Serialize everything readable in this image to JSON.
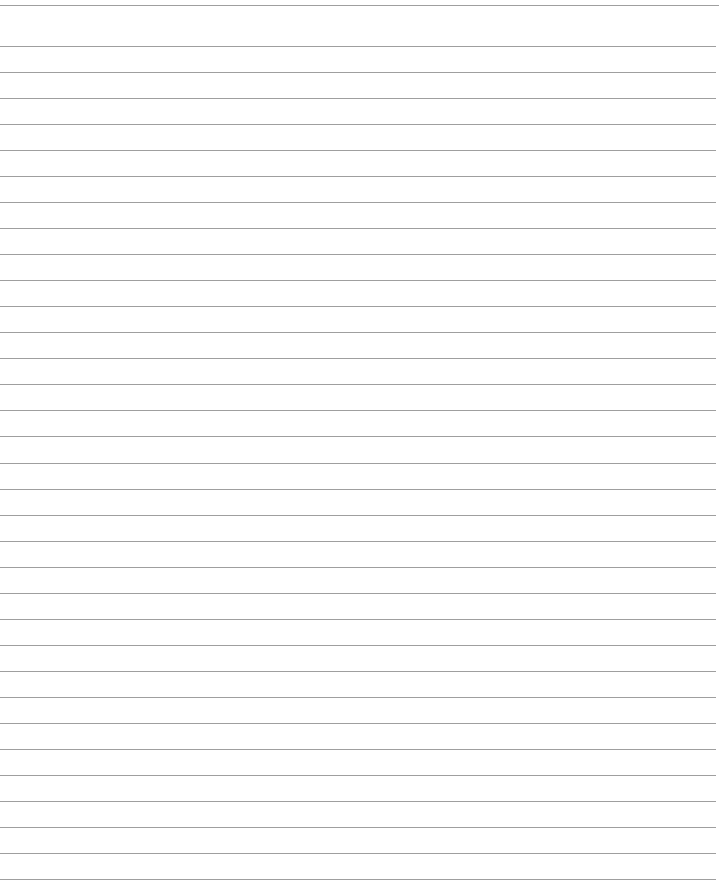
{
  "page": {
    "type": "lined-paper",
    "background_color": "#ffffff",
    "line_color": "#8e8e8e",
    "ruled_line_count": 34,
    "text_content": []
  }
}
